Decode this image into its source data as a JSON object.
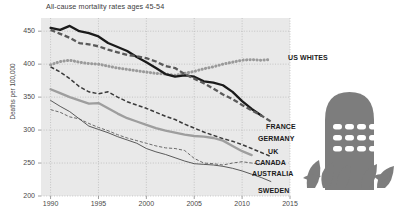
{
  "chart_data": {
    "type": "line",
    "title": "All-cause mortality rates ages 45-54",
    "xlabel": "",
    "ylabel": "Deaths per 100,000",
    "xlim": [
      1989,
      2015
    ],
    "ylim": [
      200,
      470
    ],
    "grid": true,
    "legend_position": "right-inline",
    "ytick_labels": [
      "200",
      "250",
      "300",
      "350",
      "400",
      "450"
    ],
    "ytick_values": [
      200,
      250,
      300,
      350,
      400,
      450
    ],
    "xtick_labels": [
      "1990",
      "1995",
      "2000",
      "2005",
      "2010",
      "2015"
    ],
    "xtick_values": [
      1990,
      1995,
      2000,
      2005,
      2010,
      2015
    ],
    "series": [
      {
        "name": "US WHITES",
        "label": "US WHITES",
        "color": "#9a9a9a",
        "style": "dotted-thick",
        "x": [
          1990,
          1991,
          1992,
          1993,
          1994,
          1995,
          1996,
          1997,
          1998,
          1999,
          2000,
          2001,
          2002,
          2003,
          2004,
          2005,
          2006,
          2007,
          2008,
          2009,
          2010,
          2011,
          2012,
          2013
        ],
        "values": [
          399,
          404,
          406,
          403,
          401,
          400,
          397,
          394,
          392,
          390,
          388,
          386,
          385,
          383,
          386,
          389,
          393,
          396,
          400,
          403,
          406,
          407,
          406,
          407
        ]
      },
      {
        "name": "FRANCE",
        "label": "FRANCE",
        "color": "#1a1a1a",
        "style": "solid-thick",
        "x": [
          1990,
          1991,
          1992,
          1993,
          1994,
          1995,
          1996,
          1997,
          1998,
          1999,
          2000,
          2001,
          2002,
          2003,
          2004,
          2005,
          2006,
          2007,
          2008,
          2009,
          2010,
          2011,
          2012
        ],
        "values": [
          455,
          452,
          458,
          450,
          447,
          442,
          432,
          426,
          420,
          411,
          403,
          394,
          385,
          381,
          383,
          381,
          374,
          372,
          368,
          358,
          344,
          332,
          322
        ]
      },
      {
        "name": "GERMANY",
        "label": "GERMANY",
        "color": "#5a5a5a",
        "style": "dashed-thick",
        "x": [
          1990,
          1991,
          1992,
          1993,
          1994,
          1995,
          1996,
          1997,
          1998,
          1999,
          2000,
          2001,
          2002,
          2003,
          2004,
          2005,
          2006,
          2007,
          2008,
          2009,
          2010,
          2011,
          2012,
          2013
        ],
        "values": [
          452,
          446,
          440,
          432,
          430,
          427,
          422,
          418,
          414,
          412,
          409,
          404,
          397,
          394,
          385,
          378,
          371,
          363,
          354,
          347,
          338,
          330,
          322,
          313
        ]
      },
      {
        "name": "UK",
        "label": "UK",
        "color": "#3a3a3a",
        "style": "dashed-medium",
        "x": [
          1990,
          1991,
          1992,
          1993,
          1994,
          1995,
          1996,
          1997,
          1998,
          1999,
          2000,
          2001,
          2002,
          2003,
          2004,
          2005,
          2006,
          2007,
          2008,
          2009,
          2010,
          2011,
          2012,
          2013
        ],
        "values": [
          396,
          388,
          378,
          366,
          358,
          355,
          358,
          350,
          343,
          338,
          333,
          327,
          321,
          316,
          309,
          303,
          297,
          292,
          287,
          283,
          278,
          272,
          266,
          260
        ]
      },
      {
        "name": "CANADA",
        "label": "CANADA",
        "color": "#9e9e9e",
        "style": "solid-thick-gray",
        "x": [
          1990,
          1991,
          1992,
          1993,
          1994,
          1995,
          1996,
          1997,
          1998,
          1999,
          2000,
          2001,
          2002,
          2003,
          2004,
          2005,
          2006,
          2007,
          2008,
          2009,
          2010,
          2011
        ],
        "values": [
          362,
          356,
          350,
          345,
          340,
          341,
          333,
          325,
          318,
          313,
          308,
          303,
          299,
          296,
          293,
          291,
          290,
          288,
          284,
          276,
          268,
          262
        ]
      },
      {
        "name": "AUSTRALIA",
        "label": "AUSTRALIA",
        "color": "#6a6a6a",
        "style": "dashed-thin",
        "x": [
          1990,
          1991,
          1992,
          1993,
          1994,
          1995,
          1996,
          1997,
          1998,
          1999,
          2000,
          2001,
          2002,
          2003,
          2004,
          2005,
          2006,
          2007,
          2008,
          2009,
          2010,
          2011,
          2012
        ],
        "values": [
          331,
          327,
          320,
          317,
          310,
          304,
          299,
          293,
          288,
          284,
          280,
          276,
          273,
          272,
          269,
          257,
          250,
          249,
          247,
          250,
          252,
          250,
          248
        ]
      },
      {
        "name": "SWEDEN",
        "label": "SWEDEN",
        "color": "#4a4a4a",
        "style": "solid-thin",
        "x": [
          1990,
          1991,
          1992,
          1993,
          1994,
          1995,
          1996,
          1997,
          1998,
          1999,
          2000,
          2001,
          2002,
          2003,
          2004,
          2005,
          2006,
          2007,
          2008,
          2009,
          2010,
          2011,
          2012,
          2013
        ],
        "values": [
          345,
          336,
          328,
          317,
          306,
          301,
          296,
          290,
          285,
          280,
          272,
          267,
          263,
          258,
          253,
          249,
          248,
          247,
          245,
          242,
          238,
          233,
          228,
          222
        ]
      }
    ]
  },
  "decoration": {
    "tombstone_label": "tombstone-illustration",
    "tombstone_color": "#7d7d7d"
  }
}
